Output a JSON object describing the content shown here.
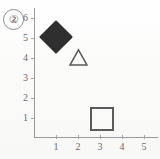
{
  "panel": {
    "label": "2",
    "label_display": "②"
  },
  "chart_data": {
    "type": "scatter",
    "title": "",
    "subtitle": "",
    "xlabel": "",
    "ylabel": "",
    "xlim": [
      0,
      5.6
    ],
    "ylim": [
      0,
      6.4
    ],
    "grid": false,
    "legend": false,
    "legend_position": "none",
    "x_ticks": [
      1,
      2,
      3,
      4,
      5
    ],
    "y_ticks": [
      1,
      2,
      3,
      4,
      5,
      6
    ],
    "x_tick_labels": [
      "1",
      "2",
      "3",
      "4",
      "5"
    ],
    "y_tick_labels": [
      "1",
      "2",
      "3",
      "4",
      "5",
      "6"
    ],
    "annotations": [
      "②"
    ],
    "points": [
      {
        "name": "filled-diamond",
        "marker": "diamond",
        "fill": "#2f2f2f",
        "stroke": "#2f2f2f",
        "filled": true,
        "size_px": 34,
        "x": 1,
        "y": 5,
        "label": ""
      },
      {
        "name": "open-triangle",
        "marker": "triangle",
        "fill": "none",
        "stroke": "#5a5a5a",
        "filled": false,
        "size_px": 19,
        "x": 2,
        "y": 4,
        "label": ""
      },
      {
        "name": "open-square",
        "marker": "square",
        "fill": "none",
        "stroke": "#5a5a5a",
        "filled": false,
        "size_px": 20,
        "x": 3,
        "y": 1,
        "label": ""
      }
    ],
    "series": [
      {
        "name": "series-1",
        "x": [
          1,
          2,
          3
        ],
        "y": [
          5,
          4,
          1
        ],
        "markers": [
          "diamond",
          "triangle",
          "square"
        ]
      }
    ]
  },
  "axes": {
    "origin_px": {
      "x": 34,
      "y": 137
    },
    "unit_px": {
      "x": 22,
      "y": 20
    },
    "color": "#9a9a9a"
  }
}
